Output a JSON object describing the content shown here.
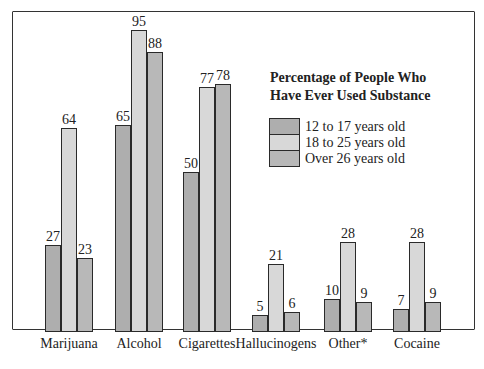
{
  "chart_data": {
    "type": "bar",
    "xlabel": "",
    "ylabel": "",
    "ylim": [
      0,
      100
    ],
    "grid": false,
    "legend_position": "upper right (inside plot)",
    "categories": [
      "Marijuana",
      "Alcohol",
      "Cigarettes",
      "Hallucinogens",
      "Other*",
      "Cocaine"
    ],
    "series": [
      {
        "name": "12 to 17 years old",
        "color": "#aeaeae",
        "values": [
          27,
          65,
          50,
          5,
          10,
          7
        ]
      },
      {
        "name": "18 to 25 years old",
        "color": "#d8d8d8",
        "values": [
          64,
          95,
          77,
          21,
          28,
          28
        ]
      },
      {
        "name": "Over 26 years old",
        "color": "#b8b8b8",
        "values": [
          23,
          88,
          78,
          6,
          9,
          9
        ]
      }
    ]
  },
  "legend": {
    "title_line1": "Percentage of People Who",
    "title_line2": "Have Ever Used Substance",
    "items": [
      "12 to 17 years old",
      "18 to 25 years old",
      "Over 26 years old"
    ]
  }
}
